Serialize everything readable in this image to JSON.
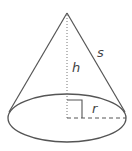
{
  "diagram": {
    "labels": {
      "height": "h",
      "slant": "s",
      "radius": "r"
    },
    "colors": {
      "stroke": "#555555",
      "background": "#ffffff"
    }
  }
}
